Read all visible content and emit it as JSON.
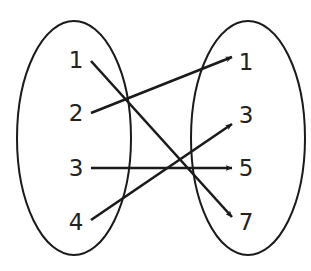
{
  "diagram": {
    "type": "mapping-diagram",
    "domain": [
      "1",
      "2",
      "3",
      "4"
    ],
    "range": [
      "1",
      "3",
      "5",
      "7"
    ],
    "mappings": [
      {
        "from": "1",
        "to": "7"
      },
      {
        "from": "2",
        "to": "1"
      },
      {
        "from": "3",
        "to": "5"
      },
      {
        "from": "4",
        "to": "3"
      }
    ],
    "colors": {
      "stroke": "#1a1a1a",
      "text": "#222222",
      "background": "#ffffff"
    }
  }
}
